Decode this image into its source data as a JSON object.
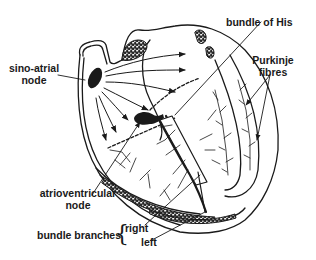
{
  "diagram": {
    "type": "anatomical illustration",
    "colors": {
      "ink": "#1a1a1a",
      "background": "#ffffff"
    },
    "labels": {
      "sino_atrial_line1": "sino-atrial",
      "sino_atrial_line2": "node",
      "bundle_of_his": "bundle of His",
      "purkinje_line1": "Purkinje",
      "purkinje_line2": "fibres",
      "av_line1": "atrioventricular",
      "av_line2": "node",
      "bundle_branches": "bundle branches",
      "brace": "{",
      "right": "right",
      "left": "left"
    }
  }
}
